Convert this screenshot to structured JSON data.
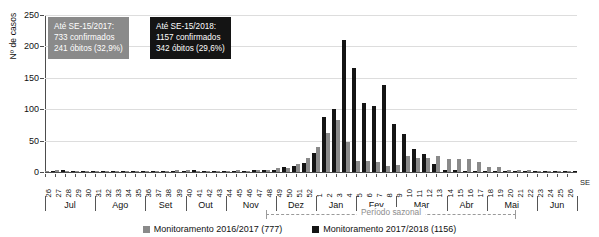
{
  "chart_data": {
    "type": "bar",
    "title": "",
    "xlabel": "SE",
    "ylabel": "Nº de casos",
    "ylim": [
      0,
      250
    ],
    "yticks": [
      0,
      50,
      100,
      150,
      200,
      250
    ],
    "grid": true,
    "legend_position": "bottom",
    "categories": [
      "26",
      "27",
      "28",
      "29",
      "30",
      "31",
      "32",
      "33",
      "34",
      "35",
      "36",
      "37",
      "38",
      "39",
      "40",
      "41",
      "42",
      "43",
      "44",
      "45",
      "46",
      "47",
      "48",
      "49",
      "50",
      "51",
      "52",
      "1",
      "2",
      "3",
      "4",
      "5",
      "6",
      "7",
      "8",
      "9",
      "10",
      "11",
      "12",
      "13",
      "14",
      "15",
      "16",
      "17",
      "18",
      "19",
      "20",
      "21",
      "22",
      "23",
      "24",
      "25",
      "26"
    ],
    "series": [
      {
        "name": "Monitoramento 2016/2017 (777)",
        "color": "#8a8a8a",
        "values": [
          2,
          3,
          2,
          2,
          1,
          1,
          1,
          2,
          1,
          1,
          1,
          2,
          2,
          3,
          3,
          2,
          2,
          2,
          2,
          3,
          2,
          3,
          4,
          7,
          6,
          12,
          22,
          40,
          62,
          83,
          47,
          18,
          17,
          16,
          9,
          11,
          25,
          22,
          22,
          25,
          20,
          20,
          20,
          16,
          8,
          8,
          3,
          3,
          3,
          2,
          2,
          1,
          1
        ]
      },
      {
        "name": "Monitoramento 2017/2018 (1156)",
        "color": "#141414",
        "values": [
          2,
          3,
          2,
          2,
          1,
          1,
          1,
          1,
          1,
          1,
          2,
          2,
          1,
          2,
          3,
          2,
          2,
          2,
          2,
          2,
          3,
          3,
          4,
          8,
          9,
          14,
          31,
          88,
          100,
          210,
          165,
          110,
          105,
          138,
          77,
          61,
          37,
          29,
          13,
          4,
          3,
          2,
          2,
          1,
          1,
          1,
          1,
          1,
          1,
          1,
          1,
          1,
          1
        ]
      }
    ],
    "months": [
      {
        "label": "Jul",
        "weeks": 5
      },
      {
        "label": "Ago",
        "weeks": 5
      },
      {
        "label": "Set",
        "weeks": 4
      },
      {
        "label": "Out",
        "weeks": 4
      },
      {
        "label": "Nov",
        "weeks": 5
      },
      {
        "label": "Dez",
        "weeks": 4
      },
      {
        "label": "Jan",
        "weeks": 4
      },
      {
        "label": "Fev",
        "weeks": 4
      },
      {
        "label": "Mar",
        "weeks": 5
      },
      {
        "label": "Abr",
        "weeks": 4
      },
      {
        "label": "Mai",
        "weeks": 5
      },
      {
        "label": "Jun",
        "weeks": 4
      }
    ]
  },
  "annotations": {
    "box_2017": {
      "line1": "Até SE-15/2017:",
      "line2": "733 confirmados",
      "line3": "241 óbitos (32,9%)",
      "color": "#8a8a8a"
    },
    "box_2018": {
      "line1": "Até SE-15/2018:",
      "line2": "1157 confirmados",
      "line3": "342 óbitos (29,6%)",
      "color": "#141414"
    },
    "seasonal_period": "Período sazonal"
  },
  "axis": {
    "y_title": "Nº de casos",
    "x_unit_label": "SE"
  }
}
